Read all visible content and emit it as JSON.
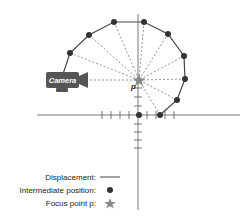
{
  "diagram": {
    "focus_label": "p",
    "camera_label": "Camera",
    "colors": {
      "path": "#444444",
      "point": "#333333",
      "star": "#888888",
      "dashed": "#666666",
      "camera_body": "#555555",
      "axis": "#555555"
    }
  },
  "legend": {
    "displacement": "Displacement:",
    "intermediate": "Intermediate position:",
    "focus": "Focus point p:"
  }
}
